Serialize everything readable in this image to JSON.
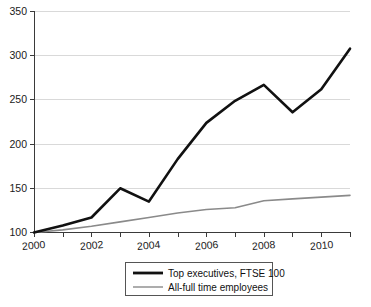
{
  "chart_data": {
    "type": "line",
    "title": "",
    "subtitle": "",
    "xlabel": "",
    "ylabel": "",
    "grid": true,
    "legend_position": "bottom",
    "x": [
      2000,
      2001,
      2002,
      2003,
      2004,
      2005,
      2006,
      2007,
      2008,
      2009,
      2010,
      2011
    ],
    "xlim": [
      2000,
      2011
    ],
    "ylim": [
      100,
      350
    ],
    "yticks": [
      100,
      150,
      200,
      250,
      300,
      350
    ],
    "ytick_labels": [
      "100",
      "150",
      "200",
      "250",
      "300",
      "350"
    ],
    "xticks": [
      2000,
      2001,
      2002,
      2003,
      2004,
      2005,
      2006,
      2007,
      2008,
      2009,
      2010,
      2011
    ],
    "xtick_labels": [
      "2000",
      "",
      "2002",
      "",
      "2004",
      "",
      "2006",
      "",
      "2008",
      "",
      "2010",
      ""
    ],
    "xtick_labels_shown": [
      "2000",
      "2002",
      "2004",
      "2006",
      "2008",
      "2010"
    ],
    "series": [
      {
        "name": "Top executives, FTSE 100",
        "color": "#111111",
        "width": 2.6,
        "values": [
          100,
          108,
          117,
          150,
          135,
          183,
          224,
          249,
          267,
          236,
          262,
          308
        ]
      },
      {
        "name": "All-full time employees",
        "color": "#8a8a8a",
        "width": 1.6,
        "values": [
          100,
          103,
          107,
          112,
          117,
          122,
          126,
          128,
          136,
          138,
          140,
          142
        ]
      }
    ]
  },
  "legend": {
    "entries": [
      {
        "label": "Top executives, FTSE 100",
        "color": "#111111",
        "width": 2.8
      },
      {
        "label": "All-full time employees",
        "color": "#8a8a8a",
        "width": 1.4
      }
    ]
  },
  "axes": {
    "y_tick_0": "100",
    "y_tick_1": "150",
    "y_tick_2": "200",
    "y_tick_3": "250",
    "y_tick_4": "300",
    "y_tick_5": "350",
    "x_tick_0": "2000",
    "x_tick_1": "2002",
    "x_tick_2": "2004",
    "x_tick_3": "2006",
    "x_tick_4": "2008",
    "x_tick_5": "2010"
  },
  "colors": {
    "background": "#ffffff",
    "grid": "#d9d9d9",
    "axis": "#3a3a3a",
    "series_dark": "#111111",
    "series_grey": "#8a8a8a"
  }
}
